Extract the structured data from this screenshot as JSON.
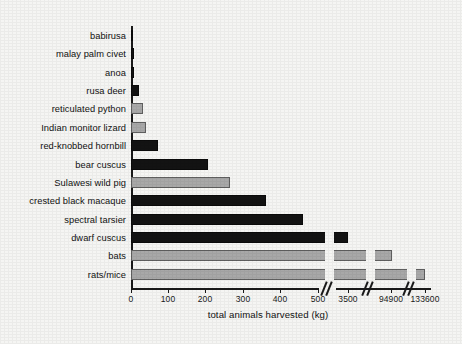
{
  "chart_data": {
    "type": "bar",
    "orientation": "horizontal",
    "title": "",
    "xlabel": "total animals harvested (kg)",
    "ylabel": "",
    "grid": false,
    "legend": "none",
    "axis_note": "broken x-axis: linear 0-500, then jumps to 3500, 94900, 133600",
    "xticks": [
      {
        "label": "0",
        "value": 0,
        "px": 131
      },
      {
        "label": "100",
        "value": 100,
        "px": 168
      },
      {
        "label": "200",
        "value": 200,
        "px": 205
      },
      {
        "label": "300",
        "value": 300,
        "px": 243
      },
      {
        "label": "400",
        "value": 400,
        "px": 280
      },
      {
        "label": "500",
        "value": 500,
        "px": 318
      },
      {
        "label": "3500",
        "value": 3500,
        "px": 348
      },
      {
        "label": "94900",
        "value": 94900,
        "px": 391
      },
      {
        "label": "133600",
        "value": 133600,
        "px": 425
      }
    ],
    "categories": [
      "babirusa",
      "malay palm civet",
      "anoa",
      "rusa deer",
      "reticulated python",
      "Indian monitor lizard",
      "red-knobbed hornbill",
      "bear cuscus",
      "Sulawesi wild pig",
      "crested black macaque",
      "spectral tarsier",
      "dwarf cuscus",
      "bats",
      "rats/mice"
    ],
    "values": [
      3,
      5,
      5,
      17,
      27,
      33,
      72,
      200,
      262,
      360,
      460,
      3500,
      94900,
      133600
    ],
    "colors": [
      "dark",
      "dark",
      "dark",
      "dark",
      "gray",
      "gray",
      "dark",
      "dark",
      "gray",
      "dark",
      "dark",
      "dark",
      "gray",
      "gray"
    ],
    "bar_pixels": [
      {
        "category": "babirusa",
        "value": 3,
        "color": "dark",
        "x": 131,
        "w": 2,
        "y": 30,
        "breaks": []
      },
      {
        "category": "malay palm civet",
        "value": 5,
        "color": "dark",
        "x": 131,
        "w": 3,
        "y": 48,
        "breaks": []
      },
      {
        "category": "anoa",
        "value": 5,
        "color": "dark",
        "x": 131,
        "w": 3,
        "y": 67,
        "breaks": []
      },
      {
        "category": "rusa deer",
        "value": 17,
        "color": "dark",
        "x": 131,
        "w": 8,
        "y": 85,
        "breaks": []
      },
      {
        "category": "reticulated python",
        "value": 27,
        "color": "gray",
        "x": 131,
        "w": 12,
        "y": 103,
        "breaks": []
      },
      {
        "category": "Indian monitor lizard",
        "value": 33,
        "color": "gray",
        "x": 131,
        "w": 15,
        "y": 122,
        "breaks": []
      },
      {
        "category": "red-knobbed hornbill",
        "value": 72,
        "color": "dark",
        "x": 131,
        "w": 27,
        "y": 140,
        "breaks": []
      },
      {
        "category": "bear cuscus",
        "value": 200,
        "color": "dark",
        "x": 131,
        "w": 77,
        "y": 159,
        "breaks": []
      },
      {
        "category": "Sulawesi wild pig",
        "value": 262,
        "color": "gray",
        "x": 131,
        "w": 99,
        "y": 177,
        "breaks": []
      },
      {
        "category": "crested black macaque",
        "value": 360,
        "color": "dark",
        "x": 131,
        "w": 135,
        "y": 195,
        "breaks": []
      },
      {
        "category": "spectral tarsier",
        "value": 460,
        "color": "dark",
        "x": 131,
        "w": 172,
        "y": 214,
        "breaks": []
      },
      {
        "category": "dwarf cuscus",
        "value": 3500,
        "color": "dark",
        "x": 131,
        "w": 217,
        "y": 232,
        "breaks": [
          325
        ]
      },
      {
        "category": "bats",
        "value": 94900,
        "color": "gray",
        "x": 131,
        "w": 261,
        "y": 250,
        "breaks": [
          325,
          366
        ]
      },
      {
        "category": "rats/mice",
        "value": 133600,
        "color": "gray",
        "x": 131,
        "w": 294,
        "y": 269,
        "breaks": [
          325,
          366,
          407
        ]
      }
    ],
    "axis_segments": [
      {
        "x": 131,
        "w": 188
      },
      {
        "x": 336,
        "w": 41
      },
      {
        "x": 377,
        "w": 41
      },
      {
        "x": 418,
        "w": 13
      }
    ],
    "breaks_px": [
      324,
      365,
      406
    ]
  }
}
